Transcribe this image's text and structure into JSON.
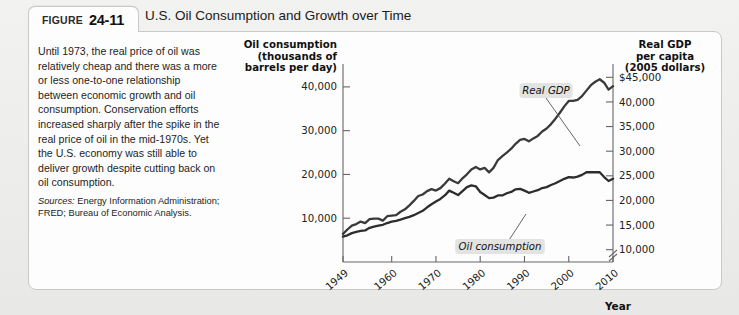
{
  "figure": {
    "label": "FIGURE",
    "number": "24-11",
    "title": "U.S. Oil Consumption and Growth over Time"
  },
  "note": {
    "body": "Until 1973, the real price of oil was relatively cheap and there was a more or less one-to-one relationship between economic growth and oil consumption. Conservation efforts increased sharply after the spike in the real price of oil in the mid-1970s. Yet the U.S. economy was still able to deliver growth despite cutting back on oil consumption.",
    "sources_lead": "Sources:",
    "sources_body": " Energy Information Administration; FRED; Bureau of Economic Analysis."
  },
  "chart_data": {
    "type": "line",
    "title": "U.S. Oil Consumption and Growth over Time",
    "xlabel": "Year",
    "left_axis_title": [
      "Oil consumption",
      "(thousands of",
      "barrels per day)"
    ],
    "right_axis_title": [
      "Real GDP",
      "per capita",
      "(2005 dollars)"
    ],
    "left_ticks": [
      "10,000",
      "20,000",
      "30,000",
      "40,000"
    ],
    "left_tick_values": [
      10000,
      20000,
      30000,
      40000
    ],
    "left_ylim": [
      0,
      45000
    ],
    "right_ticks": [
      "10,000",
      "15,000",
      "20,000",
      "25,000",
      "30,000",
      "35,000",
      "40,000",
      "$45,000"
    ],
    "right_tick_values": [
      10000,
      15000,
      20000,
      25000,
      30000,
      35000,
      40000,
      45000
    ],
    "right_ylim": [
      7500,
      47500
    ],
    "xticks": [
      "1949",
      "1960",
      "1970",
      "1980",
      "1990",
      "2000",
      "2010"
    ],
    "xtick_values": [
      1949,
      1960,
      1970,
      1980,
      1990,
      2000,
      2010
    ],
    "xlim": [
      1949,
      2010
    ],
    "grid": false,
    "axis_break": true,
    "legend_position": "inline-callouts",
    "series": [
      {
        "name": "Real GDP",
        "callout_label": "Real GDP",
        "axis": "right",
        "color": "#3a3a3a",
        "x": [
          1949,
          1950,
          1951,
          1952,
          1953,
          1954,
          1955,
          1956,
          1957,
          1958,
          1959,
          1960,
          1961,
          1962,
          1963,
          1964,
          1965,
          1966,
          1967,
          1968,
          1969,
          1970,
          1971,
          1972,
          1973,
          1974,
          1975,
          1976,
          1977,
          1978,
          1979,
          1980,
          1981,
          1982,
          1983,
          1984,
          1985,
          1986,
          1987,
          1988,
          1989,
          1990,
          1991,
          1992,
          1993,
          1994,
          1995,
          1996,
          1997,
          1998,
          1999,
          2000,
          2001,
          2002,
          2003,
          2004,
          2005,
          2006,
          2007,
          2008,
          2009,
          2010
        ],
        "values": [
          13200,
          14100,
          14900,
          15200,
          15700,
          15400,
          16200,
          16300,
          16300,
          15900,
          16800,
          16900,
          17000,
          17700,
          18200,
          19000,
          19900,
          20900,
          21200,
          21900,
          22300,
          22000,
          22500,
          23400,
          24400,
          23900,
          23500,
          24500,
          25300,
          26300,
          26800,
          26300,
          26600,
          25700,
          26600,
          28200,
          29000,
          29700,
          30500,
          31500,
          32300,
          32500,
          32000,
          32600,
          33100,
          34000,
          34600,
          35500,
          36600,
          37800,
          39100,
          40200,
          40200,
          40400,
          41200,
          42300,
          43400,
          44100,
          44600,
          43900,
          42500,
          43200
        ]
      },
      {
        "name": "Oil consumption",
        "callout_label": "Oil consumption",
        "axis": "left",
        "color": "#2d2d2d",
        "x": [
          1949,
          1950,
          1951,
          1952,
          1953,
          1954,
          1955,
          1956,
          1957,
          1958,
          1959,
          1960,
          1961,
          1962,
          1963,
          1964,
          1965,
          1966,
          1967,
          1968,
          1969,
          1970,
          1971,
          1972,
          1973,
          1974,
          1975,
          1976,
          1977,
          1978,
          1979,
          1980,
          1981,
          1982,
          1983,
          1984,
          1985,
          1986,
          1987,
          1988,
          1989,
          1990,
          1991,
          1992,
          1993,
          1994,
          1995,
          1996,
          1997,
          1998,
          1999,
          2000,
          2001,
          2002,
          2003,
          2004,
          2005,
          2006,
          2007,
          2008,
          2009,
          2010
        ],
        "values": [
          5800,
          6100,
          6600,
          6900,
          7100,
          7200,
          7800,
          8100,
          8300,
          8500,
          8900,
          9200,
          9400,
          9700,
          10000,
          10300,
          10700,
          11200,
          11700,
          12500,
          13200,
          13800,
          14400,
          15200,
          16300,
          15800,
          15300,
          16200,
          17100,
          17500,
          17300,
          16000,
          15300,
          14600,
          14700,
          15200,
          15200,
          15700,
          16000,
          16600,
          16700,
          16300,
          15800,
          16100,
          16400,
          16900,
          17100,
          17600,
          18000,
          18500,
          19000,
          19400,
          19300,
          19500,
          19900,
          20500,
          20500,
          20500,
          20500,
          19400,
          18500,
          19000
        ]
      }
    ]
  },
  "callouts": {
    "gdp": "Real GDP",
    "oil": "Oil consumption"
  },
  "colors": {
    "panel_bg": "#fdfdfd",
    "page_bg": "#eeeeec",
    "line": "#333333",
    "axis": "#555555",
    "callout_bg": "#e3e3e1"
  }
}
